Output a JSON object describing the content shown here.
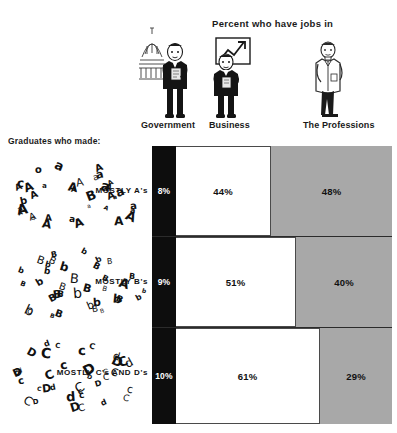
{
  "header": {
    "title": "Percent who have jobs in"
  },
  "columns": [
    {
      "key": "government",
      "label": "Government",
      "icon": "capitol-government-figure-icon"
    },
    {
      "key": "business",
      "label": "Business",
      "icon": "businessman-chart-figure-icon"
    },
    {
      "key": "professions",
      "label": "The Professions",
      "icon": "professional-labcoat-figure-icon"
    }
  ],
  "left": {
    "caption": "Graduates who made:"
  },
  "rows": [
    {
      "key": "mostly-as",
      "label": "MOSTLY A's",
      "cloud_letters": "A a A a A A a A a A A a A a A A b A a c A a A o A a A A a A B a A a A a",
      "values": [
        "8%",
        "44%",
        "48%"
      ]
    },
    {
      "key": "mostly-bs",
      "label": "MOSTLY B's",
      "cloud_letters": "B b B b B B b B b B B b B c B b B b B b B B b B b B b B B b B A b B b B",
      "values": [
        "9%",
        "51%",
        "40%"
      ]
    },
    {
      "key": "mostly-cs-ds",
      "label": "MOSTLY C's AND D's",
      "cloud_letters": "C d D c C D d C c D C d D C c d C D d C c C D d C c D d C D c C d D c C",
      "values": [
        "10%",
        "61%",
        "29%"
      ]
    }
  ],
  "colors": {
    "government": "#0d0d0d",
    "business": "#ffffff",
    "professions": "#a8a8a8",
    "outline": "#4a4a4a",
    "text": "#111111"
  },
  "chart_data": {
    "type": "bar",
    "subtype": "stacked-horizontal-100",
    "title": "Percent who have jobs in",
    "xlabel": "",
    "ylabel": "",
    "xlim": [
      0,
      100
    ],
    "grid": false,
    "legend_position": "top-columns",
    "categories": [
      "MOSTLY A's",
      "MOSTLY B's",
      "MOSTLY C's AND D's"
    ],
    "series": [
      {
        "name": "Government",
        "values": [
          8,
          44,
          48
        ]
      },
      {
        "name": "Business",
        "values": [
          9,
          51,
          40
        ]
      },
      {
        "name": "The Professions",
        "values": [
          10,
          61,
          29
        ]
      }
    ],
    "rows": [
      {
        "category": "MOSTLY A's",
        "Government": 8,
        "Business": 44,
        "The Professions": 48
      },
      {
        "category": "MOSTLY B's",
        "Government": 9,
        "Business": 51,
        "The Professions": 40
      },
      {
        "category": "MOSTLY C's AND D's",
        "Government": 10,
        "Business": 61,
        "The Professions": 29
      }
    ],
    "annotations": [
      "Graduates who made:"
    ]
  }
}
